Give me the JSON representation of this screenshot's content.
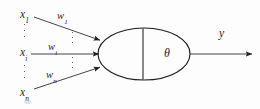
{
  "figure": {
    "type": "diagram",
    "background_color": "#fdfdfd",
    "stroke_color": "#1f1f1f",
    "width": 260,
    "height": 109
  },
  "inputs": [
    {
      "id": "x1",
      "base": "x",
      "subscript": "1",
      "x": 20,
      "y": 9
    },
    {
      "id": "xi",
      "base": "x",
      "subscript": "i",
      "x": 20,
      "y": 47
    },
    {
      "id": "xn",
      "base": "x",
      "subscript": "n",
      "x": 20,
      "y": 87
    }
  ],
  "weights": [
    {
      "id": "w1",
      "base": "w",
      "subscript": "1",
      "x": 57,
      "y": 11
    },
    {
      "id": "wi",
      "base": "w",
      "subscript": "i",
      "x": 48,
      "y": 42
    },
    {
      "id": "wn",
      "base": "w",
      "subscript": "n",
      "x": 46,
      "y": 70
    }
  ],
  "ellipses_dots": [
    {
      "id": "input-dots-upper",
      "x": 24,
      "y": 24,
      "height": 13
    },
    {
      "id": "input-dots-lower",
      "x": 24,
      "y": 65,
      "height": 13
    },
    {
      "id": "weight-dots-upper",
      "x": 72,
      "y": 32,
      "height": 11
    },
    {
      "id": "weight-dots-lower",
      "x": 72,
      "y": 57,
      "height": 11
    }
  ],
  "neuron": {
    "label": "theta-symbol",
    "symbol": "θ",
    "symbol_x": 164,
    "symbol_y": 47,
    "ellipse": {
      "cx": 144,
      "cy": 54,
      "rx": 46,
      "ry": 26
    },
    "divider_x": 143
  },
  "output": {
    "label": "y",
    "label_x": 219,
    "label_y": 28,
    "arrow": {
      "x1": 190,
      "y1": 54,
      "x2": 252,
      "y2": 54
    }
  },
  "connections": [
    {
      "id": "connection-x1",
      "from": "x1",
      "to": "neuron",
      "x1": 34,
      "y1": 17,
      "x2": 100,
      "y2": 40
    },
    {
      "id": "connection-xi",
      "from": "xi",
      "to": "neuron",
      "x1": 31,
      "y1": 54,
      "x2": 99,
      "y2": 54
    },
    {
      "id": "connection-xn",
      "from": "xn",
      "to": "neuron",
      "x1": 34,
      "y1": 89,
      "x2": 100,
      "y2": 67
    }
  ]
}
